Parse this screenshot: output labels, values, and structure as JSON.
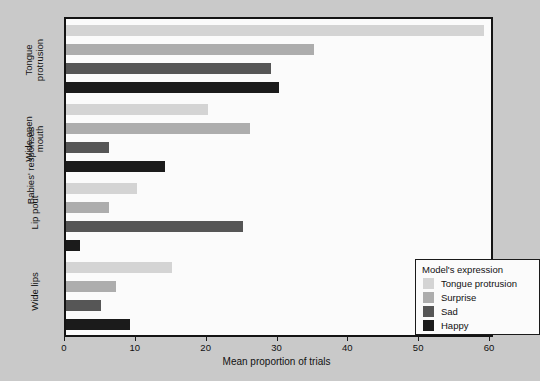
{
  "chart_data": {
    "type": "bar",
    "orientation": "horizontal",
    "title": "",
    "xlabel": "Mean proportion of trials",
    "ylabel": "Babies' responses",
    "xlim": [
      0,
      60
    ],
    "xticks": [
      0,
      10,
      20,
      30,
      40,
      50,
      60
    ],
    "grid": false,
    "legend_title": "Model's expression",
    "legend_position": "inside-lower-right",
    "categories": [
      "Tongue protrusion",
      "Wide open mouth",
      "Lip pout",
      "Wide lips"
    ],
    "series": [
      {
        "name": "Tongue protrusion",
        "color": "#d4d4d4",
        "values": [
          59,
          20,
          10,
          15
        ]
      },
      {
        "name": "Surprise",
        "color": "#adadad",
        "values": [
          35,
          26,
          6,
          7
        ]
      },
      {
        "name": "Sad",
        "color": "#565656",
        "values": [
          29,
          6,
          25,
          5
        ]
      },
      {
        "name": "Happy",
        "color": "#1b1b1b",
        "values": [
          30,
          14,
          2,
          9
        ]
      }
    ]
  },
  "axis": {
    "x_tick_labels": [
      "0",
      "10",
      "20",
      "30",
      "40",
      "50",
      "60"
    ],
    "x_title": "Mean proportion of trials",
    "y_title": "Babies' responses",
    "y_categories": [
      {
        "line1": "Tongue",
        "line2": "protrusion"
      },
      {
        "line1": "Wide open",
        "line2": "mouth"
      },
      {
        "line1": "Lip pout",
        "line2": ""
      },
      {
        "line1": "Wide lips",
        "line2": ""
      }
    ]
  },
  "legend": {
    "title": "Model's expression",
    "items": [
      {
        "label": "Tongue protrusion",
        "color": "#d4d4d4"
      },
      {
        "label": "Surprise",
        "color": "#adadad"
      },
      {
        "label": "Sad",
        "color": "#565656"
      },
      {
        "label": "Happy",
        "color": "#1b1b1b"
      }
    ]
  },
  "colors": {
    "page_background": "#c9c9c9",
    "plot_background": "#fbfbfb",
    "frame": "#141414",
    "text": "#111111"
  }
}
